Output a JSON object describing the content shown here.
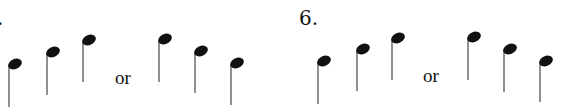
{
  "exercises": [
    {
      "number": ".",
      "connector": "or",
      "sequence_a": {
        "direction": "ascending",
        "notes": [
          {
            "x": 15,
            "y": 64,
            "stem_bottom": 107
          },
          {
            "x": 53,
            "y": 52,
            "stem_bottom": 95
          },
          {
            "x": 89,
            "y": 40,
            "stem_bottom": 82
          }
        ]
      },
      "sequence_b": {
        "direction": "descending",
        "notes": [
          {
            "x": 165,
            "y": 39,
            "stem_bottom": 82
          },
          {
            "x": 201,
            "y": 51,
            "stem_bottom": 93
          },
          {
            "x": 237,
            "y": 63,
            "stem_bottom": 105
          }
        ]
      }
    },
    {
      "number": "6.",
      "connector": "or",
      "sequence_a": {
        "direction": "ascending",
        "notes": [
          {
            "x": 324,
            "y": 61,
            "stem_bottom": 104
          },
          {
            "x": 363,
            "y": 49,
            "stem_bottom": 91
          },
          {
            "x": 398,
            "y": 38,
            "stem_bottom": 80
          }
        ]
      },
      "sequence_b": {
        "direction": "descending",
        "notes": [
          {
            "x": 474,
            "y": 37,
            "stem_bottom": 80
          },
          {
            "x": 510,
            "y": 49,
            "stem_bottom": 92
          },
          {
            "x": 546,
            "y": 61,
            "stem_bottom": 102
          }
        ]
      }
    }
  ],
  "colors": {
    "ink": "#111111",
    "stem": "#555555"
  }
}
